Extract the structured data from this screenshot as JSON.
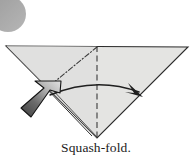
{
  "figure": {
    "kind": "origami-instruction-diagram",
    "caption": "Squash-fold.",
    "background_color": "#ffffff",
    "canvas": {
      "width": 192,
      "height": 161
    }
  },
  "corner_mark": {
    "name": "page-corner-circle",
    "shape": "circle",
    "color": "#a8a8a8",
    "center_x": 8,
    "center_y": 14,
    "radius": 18
  },
  "paper": {
    "name": "folded-paper-triangle",
    "fill_color": "#e4e4e2",
    "fill_color_shaded": "#dcdcda",
    "outline_color": "#2b2b2b",
    "vertices": [
      {
        "label": "left-corner",
        "x": 6,
        "y": 46
      },
      {
        "label": "right-corner",
        "x": 188,
        "y": 47
      },
      {
        "label": "bottom-apex",
        "x": 97,
        "y": 138
      }
    ],
    "layer_edge": {
      "name": "lower-left-layer-edge",
      "from_x": 46,
      "from_y": 88,
      "to_x": 92,
      "to_y": 136
    }
  },
  "creases": [
    {
      "name": "valley-fold-line",
      "style": "dashed",
      "color": "#3a3a3a",
      "from_x": 97,
      "from_y": 46,
      "to_x": 97,
      "to_y": 138
    },
    {
      "name": "mountain-fold-line",
      "style": "dash-dot",
      "color": "#3a3a3a",
      "from_x": 97,
      "from_y": 47,
      "to_x": 47,
      "to_y": 88
    }
  ],
  "arrows": [
    {
      "name": "fold-motion-arrow",
      "type": "curved",
      "color": "#1f1f1f",
      "direction": "left-to-right",
      "start_x": 50,
      "start_y": 94,
      "end_x": 143,
      "end_y": 96
    },
    {
      "name": "push-arrow",
      "type": "push",
      "direction": "up-right",
      "gradient_from": "#4a4a4a",
      "gradient_to": "#dcdcdc",
      "outline_color": "#141414",
      "tip_x": 60,
      "tip_y": 82,
      "tail_x": 22,
      "tail_y": 118
    }
  ]
}
